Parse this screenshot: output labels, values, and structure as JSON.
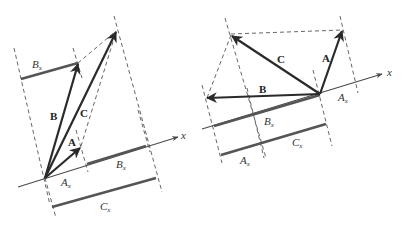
{
  "left_figure": {
    "labels": {
      "vector_a": "A",
      "vector_b": "B",
      "vector_c": "C",
      "axis": "x",
      "bx_top": "B",
      "bx_top_sub": "x",
      "ax": "A",
      "ax_sub": "x",
      "bx_axis": "B",
      "bx_axis_sub": "x",
      "cx": "C",
      "cx_sub": "x"
    }
  },
  "right_figure": {
    "labels": {
      "vector_a": "A",
      "vector_b": "B",
      "vector_c": "C",
      "axis": "x",
      "ax_right": "A",
      "ax_right_sub": "x",
      "bx": "B",
      "bx_sub": "x",
      "cx": "C",
      "cx_sub": "x",
      "ax_bottom": "A",
      "ax_bottom_sub": "x"
    }
  }
}
